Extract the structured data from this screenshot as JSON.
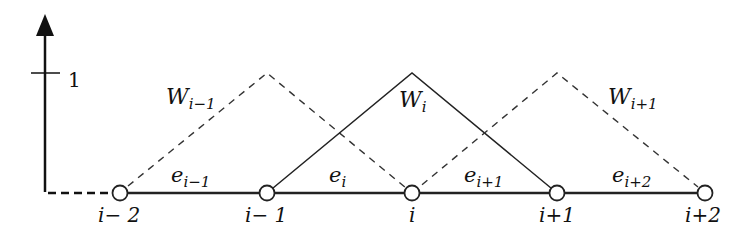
{
  "diagram": {
    "axis": {
      "tick_label": "1"
    },
    "nodes": [
      {
        "label": "i− 2",
        "x": 120
      },
      {
        "label": "i− 1",
        "x": 267
      },
      {
        "label": "i",
        "x": 412
      },
      {
        "label": "i+1",
        "x": 557
      },
      {
        "label": "i+2",
        "x": 705
      }
    ],
    "elements": [
      {
        "base": "e",
        "sub": "i−1"
      },
      {
        "base": "e",
        "sub": "i"
      },
      {
        "base": "e",
        "sub": "i+1"
      },
      {
        "base": "e",
        "sub": "i+2"
      }
    ],
    "basis_functions": [
      {
        "base": "W",
        "sub": "i−1",
        "style": "dashed"
      },
      {
        "base": "W",
        "sub": "i",
        "style": "solid"
      },
      {
        "base": "W",
        "sub": "i+1",
        "style": "dashed"
      }
    ],
    "colors": {
      "line": "#222222",
      "background": "#ffffff"
    }
  }
}
